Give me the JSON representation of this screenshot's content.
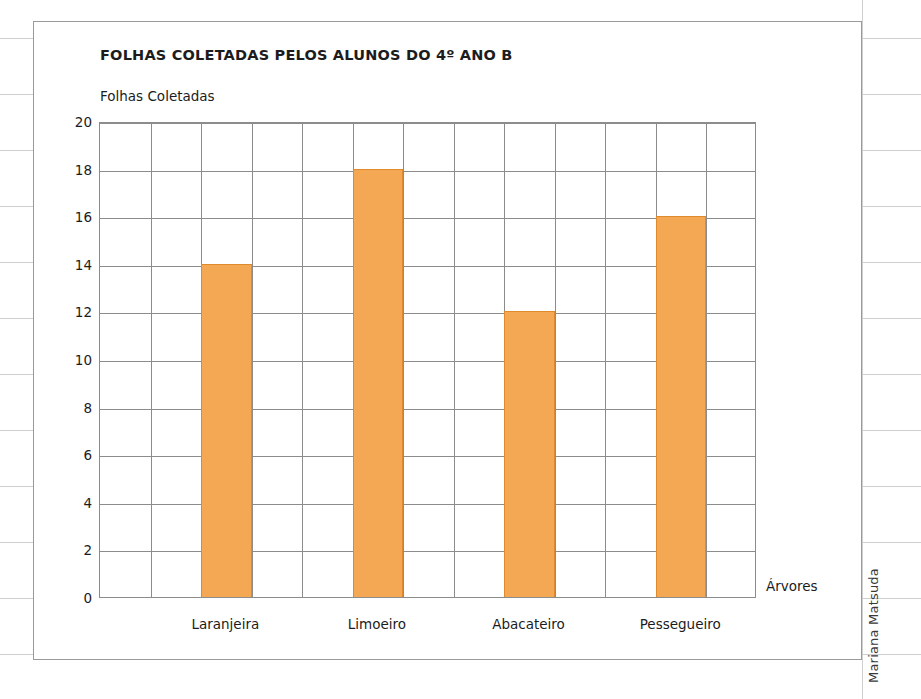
{
  "credit": "Mariana Matsuda",
  "colors": {
    "bar_fill": "#F5A853",
    "bar_stroke": "#E08A2E",
    "grid": "#8c8c8c",
    "page_rule": "#cfcfcf",
    "text": "#1c1c1c",
    "card_border": "#9a9a9a"
  },
  "chart_data": {
    "type": "bar",
    "title": "FOLHAS COLETADAS PELOS ALUNOS DO 4º ANO B",
    "ylabel": "Folhas Coletadas",
    "xlabel": "Árvores",
    "categories": [
      "Laranjeira",
      "Limoeiro",
      "Abacateiro",
      "Pessegueiro"
    ],
    "values": [
      14,
      18,
      12,
      16
    ],
    "ylim": [
      0,
      20
    ],
    "ytick_step": 2,
    "yticks": [
      0,
      2,
      4,
      6,
      8,
      10,
      12,
      14,
      16,
      18,
      20
    ],
    "ytick_labels": [
      "0",
      "2",
      "4",
      "6",
      "8",
      "10",
      "12",
      "14",
      "16",
      "18",
      "20"
    ],
    "grid": true,
    "grid_columns": 13,
    "bar_columns": [
      2,
      5,
      8,
      11
    ],
    "legend": null,
    "legend_position": "none"
  }
}
